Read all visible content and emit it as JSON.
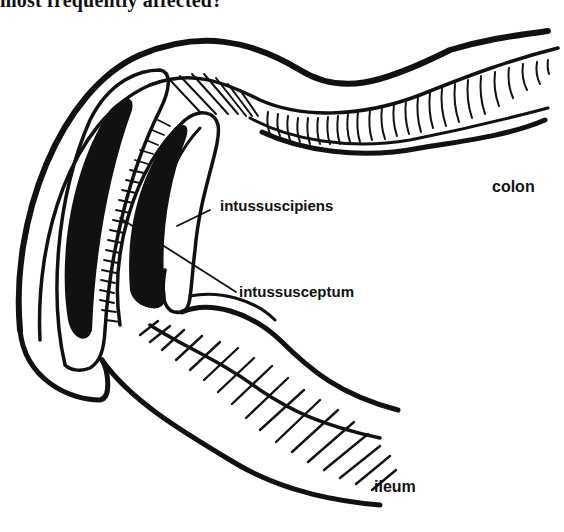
{
  "question": {
    "text": "most frequently affected?"
  },
  "diagram": {
    "labels": {
      "colon": "colon",
      "intussuscipiens": "intussuscipiens",
      "intussusceptum": "intussusceptum",
      "ileum": "ileum"
    },
    "colors": {
      "ink": "#111111",
      "background": "#ffffff"
    }
  }
}
